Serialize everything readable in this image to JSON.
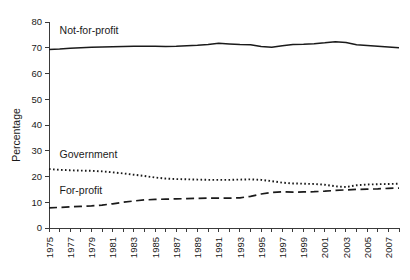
{
  "chart_data": {
    "type": "line",
    "title": "",
    "xlabel": "",
    "ylabel": "Percentage",
    "xlim": [
      1975,
      2008
    ],
    "ylim": [
      0,
      80
    ],
    "ytick_step": 10,
    "xtick_step": 1,
    "xlabel_step": 2,
    "grid": false,
    "legend_position": "inline-annotations",
    "yticks": [
      "0",
      "10",
      "20",
      "30",
      "40",
      "50",
      "60",
      "70",
      "80"
    ],
    "x": [
      1975,
      1976,
      1977,
      1978,
      1979,
      1980,
      1981,
      1982,
      1983,
      1984,
      1985,
      1986,
      1987,
      1988,
      1989,
      1990,
      1991,
      1992,
      1993,
      1994,
      1995,
      1996,
      1997,
      1998,
      1999,
      2000,
      2001,
      2002,
      2003,
      2004,
      2005,
      2006,
      2007,
      2008
    ],
    "xticklabels": [
      "1975",
      "1977",
      "1979",
      "1981",
      "1983",
      "1985",
      "1987",
      "1989",
      "1991",
      "1993",
      "1995",
      "1997",
      "1999",
      "2001",
      "2003",
      "2005",
      "2007"
    ],
    "series": [
      {
        "name": "Not-for-profit",
        "style": "solid",
        "color": "#1a1a1a",
        "label_x": 1976.0,
        "label_y": 75.5,
        "values": [
          69.3,
          69.5,
          69.8,
          70.0,
          70.2,
          70.3,
          70.4,
          70.5,
          70.6,
          70.6,
          70.6,
          70.5,
          70.6,
          70.8,
          71.0,
          71.3,
          71.7,
          71.5,
          71.3,
          71.2,
          70.5,
          70.2,
          70.8,
          71.3,
          71.4,
          71.6,
          71.9,
          72.3,
          72.0,
          71.2,
          70.9,
          70.6,
          70.3,
          70.0
        ]
      },
      {
        "name": "Government",
        "style": "dotted",
        "color": "#1a1a1a",
        "label_x": 1976.0,
        "label_y": 27.0,
        "values": [
          22.9,
          22.6,
          22.4,
          22.3,
          22.2,
          22.0,
          21.6,
          21.2,
          20.7,
          20.2,
          19.6,
          19.2,
          19.0,
          18.9,
          18.8,
          18.7,
          18.7,
          18.7,
          18.8,
          18.9,
          18.7,
          18.2,
          17.6,
          17.3,
          17.2,
          17.1,
          16.8,
          16.2,
          15.9,
          16.6,
          16.9,
          17.0,
          17.1,
          17.2
        ]
      },
      {
        "name": "For-profit",
        "style": "dashed",
        "color": "#1a1a1a",
        "label_x": 1976.0,
        "label_y": 13.2,
        "values": [
          7.8,
          8.0,
          8.2,
          8.4,
          8.6,
          8.9,
          9.4,
          10.0,
          10.5,
          10.9,
          11.1,
          11.2,
          11.3,
          11.4,
          11.5,
          11.6,
          11.6,
          11.6,
          11.7,
          12.3,
          13.2,
          13.8,
          14.1,
          13.9,
          14.0,
          14.1,
          14.3,
          14.6,
          14.8,
          15.0,
          15.1,
          15.2,
          15.4,
          15.5
        ]
      }
    ]
  }
}
